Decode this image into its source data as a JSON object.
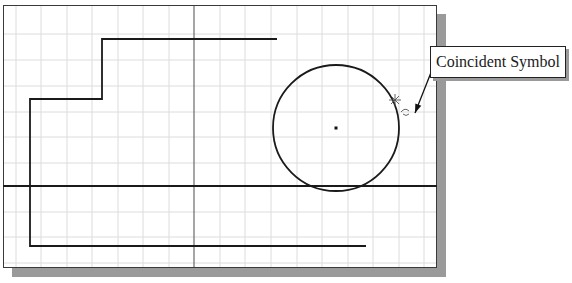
{
  "sketch": {
    "grid": {
      "spacing": 25.6,
      "color": "#dcdcdc",
      "vertical_lines_x": [
        16,
        41,
        67,
        92,
        118,
        143,
        169,
        220,
        245,
        271,
        297,
        322,
        348,
        373,
        399,
        424
      ],
      "horizontal_lines_y": [
        34,
        60,
        86,
        112,
        137,
        163,
        212,
        237,
        263
      ]
    },
    "axes": {
      "y_axis_x": 194,
      "x_axis_y": 186,
      "color": "#6a6a6a"
    },
    "polyline": {
      "points": "277,39 102,39 102,99 30,99 30,246 366,246",
      "color": "#1a1a1a"
    },
    "horizontal_line": {
      "x1": 3,
      "y1": 186,
      "x2": 437,
      "y2": 186,
      "color": "#1a1a1a"
    },
    "circle": {
      "cx": 336,
      "cy": 128,
      "r": 63,
      "color": "#1a1a1a"
    },
    "center_point": {
      "x": 336,
      "y": 128
    },
    "coincident_marker": {
      "x": 395,
      "y": 100
    }
  },
  "callout": {
    "label": "Coincident Symbol",
    "arrow_from": {
      "x": 432,
      "y": 70
    },
    "arrow_to": {
      "x": 415,
      "y": 113
    }
  }
}
